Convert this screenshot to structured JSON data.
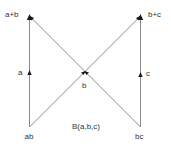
{
  "diagram": {
    "caption": "B(a,b,c)",
    "nodes": {
      "top_left": "a+b",
      "top_right": "b+c",
      "bottom_left": "ab",
      "bottom_right": "bc",
      "center": "b"
    },
    "edge_labels": {
      "left_vertical": "a",
      "right_vertical": "c"
    },
    "edges": [
      {
        "from": "ab",
        "to": "a+b",
        "label": "a"
      },
      {
        "from": "bc",
        "to": "b+c",
        "label": "c"
      },
      {
        "from": "ab",
        "to": "b+c",
        "via": "b"
      },
      {
        "from": "bc",
        "to": "a+b",
        "via": "b"
      }
    ],
    "colors": {
      "line": "#8a8a8a",
      "arrow": "#1a1a1a",
      "text": "#333333",
      "background": "#ffffff"
    }
  }
}
